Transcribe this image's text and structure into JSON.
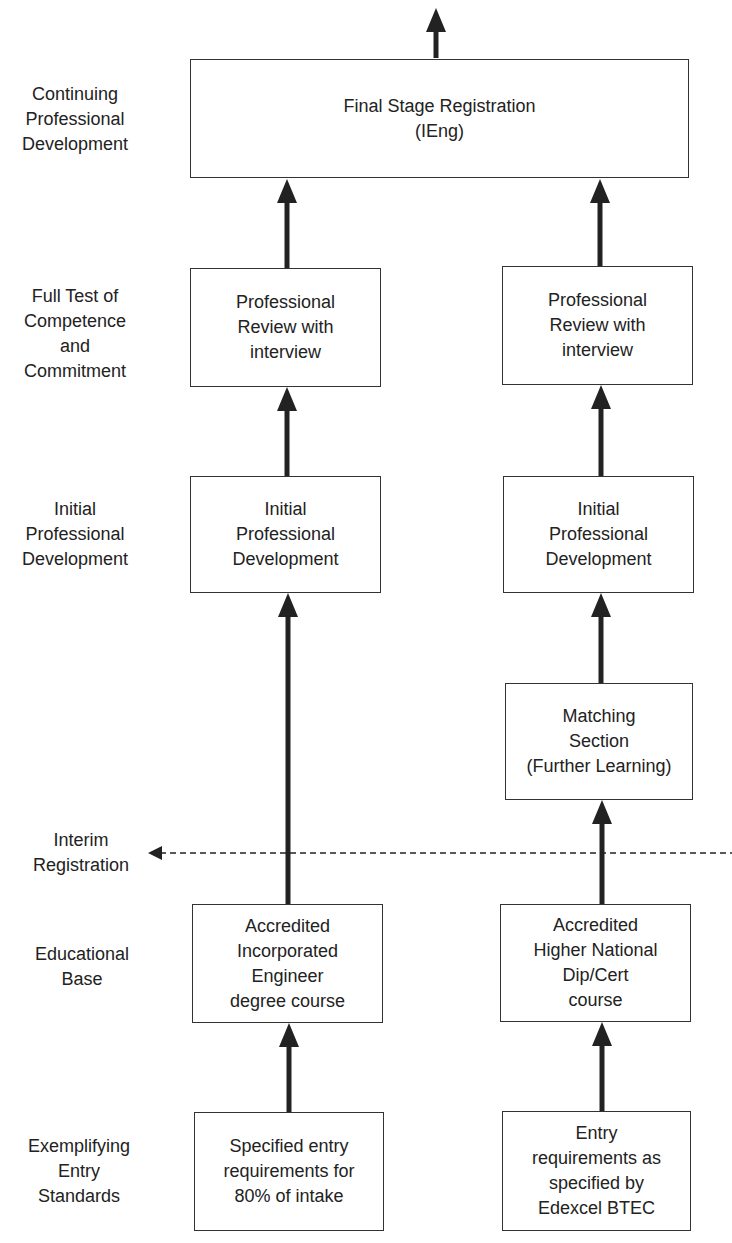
{
  "stage_labels": {
    "cpd": "Continuing\nProfessional\nDevelopment",
    "full_test": "Full Test of\nCompetence\nand\nCommitment",
    "ipd": "Initial\nProfessional\nDevelopment",
    "interim": "Interim\nRegistration",
    "educational_base": "Educational\nBase",
    "entry_standards": "Exemplifying\nEntry\nStandards"
  },
  "boxes": {
    "final": "Final Stage Registration\n(IEng)",
    "left": {
      "review": "Professional\nReview with\ninterview",
      "ipd": "Initial\nProfessional\nDevelopment",
      "education": "Accredited\nIncorporated\nEngineer\ndegree course",
      "entry": "Specified entry\nrequirements for\n80% of intake"
    },
    "right": {
      "review": "Professional\nReview with\ninterview",
      "ipd": "Initial\nProfessional\nDevelopment",
      "matching": "Matching\nSection\n(Further Learning)",
      "education": "Accredited\nHigher National\nDip/Cert\ncourse",
      "entry": "Entry\nrequirements as\nspecified by\nEdexcel BTEC"
    }
  },
  "colors": {
    "line": "#222222",
    "border": "#333333",
    "background": "#ffffff"
  }
}
